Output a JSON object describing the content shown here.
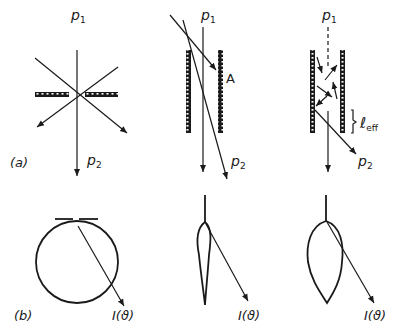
{
  "figure": {
    "panel_a_label": "(a)",
    "panel_b_label": "(b)",
    "top": {
      "left": {
        "p1": "p",
        "p1_sub": "1",
        "p2": "p",
        "p2_sub": "2"
      },
      "middle": {
        "p1": "p",
        "p1_sub": "1",
        "p2": "p",
        "p2_sub": "2",
        "point_label": "A"
      },
      "right": {
        "p1": "p",
        "p1_sub": "1",
        "p2": "p",
        "p2_sub": "2",
        "length_label": "ℓ",
        "length_sub": "eff"
      }
    },
    "bottom": {
      "left": {
        "intensity_label": "I(ϑ)"
      },
      "middle": {
        "intensity_label": "I(ϑ)"
      },
      "right": {
        "intensity_label": "I(ϑ)"
      }
    }
  },
  "colors": {
    "ink": "#1a1a1a",
    "background": "#ffffff"
  }
}
